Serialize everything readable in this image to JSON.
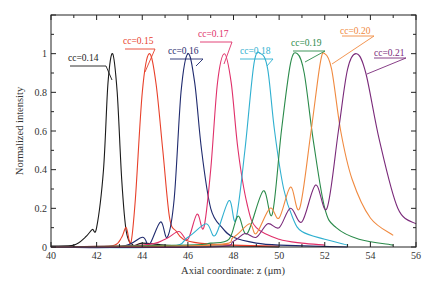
{
  "chart_data": {
    "type": "line",
    "title": "",
    "xlabel": "Axial coordinate: z (μm)",
    "ylabel": "Normalized intensity",
    "xlim": [
      40,
      56
    ],
    "ylim": [
      0,
      1.2
    ],
    "xticks": [
      "40",
      "42",
      "44",
      "46",
      "48",
      "50",
      "52",
      "54",
      "56"
    ],
    "yticks": [
      "0",
      "0.2",
      "0.4",
      "0.6",
      "0.8",
      "1"
    ],
    "grid": false,
    "legend": "inline annotations",
    "series": [
      {
        "name": "cc=0.14",
        "color": "#1a1a1a",
        "peak_z": 42.7,
        "points": [
          [
            40,
            0.005
          ],
          [
            41,
            0.01
          ],
          [
            41.5,
            0.05
          ],
          [
            41.8,
            0.09
          ],
          [
            42.0,
            0.1
          ],
          [
            42.3,
            0.4
          ],
          [
            42.5,
            0.85
          ],
          [
            42.7,
            1.0
          ],
          [
            42.9,
            0.8
          ],
          [
            43.1,
            0.35
          ],
          [
            43.3,
            0.08
          ],
          [
            43.6,
            0.01
          ],
          [
            44,
            0.02
          ],
          [
            45,
            0.01
          ],
          [
            46,
            0.005
          ],
          [
            48,
            0.005
          ],
          [
            50,
            0.0
          ]
        ]
      },
      {
        "name": "cc=0.15",
        "color": "#e8402a",
        "peak_z": 44.3,
        "points": [
          [
            40,
            0.0
          ],
          [
            42,
            0.0
          ],
          [
            42.8,
            0.01
          ],
          [
            43.1,
            0.05
          ],
          [
            43.3,
            0.1
          ],
          [
            43.5,
            0.02
          ],
          [
            43.7,
            0.25
          ],
          [
            44.0,
            0.8
          ],
          [
            44.3,
            1.0
          ],
          [
            44.6,
            0.85
          ],
          [
            44.9,
            0.5
          ],
          [
            45.2,
            0.15
          ],
          [
            45.5,
            0.08
          ],
          [
            45.8,
            0.04
          ],
          [
            46.5,
            0.02
          ],
          [
            48,
            0.01
          ],
          [
            50,
            0.005
          ]
        ]
      },
      {
        "name": "cc=0.16",
        "color": "#1f2a6e",
        "peak_z": 46.0,
        "points": [
          [
            40,
            0.0
          ],
          [
            43,
            0.0
          ],
          [
            44.0,
            0.05
          ],
          [
            44.3,
            0.01
          ],
          [
            44.8,
            0.13
          ],
          [
            45.1,
            0.05
          ],
          [
            45.4,
            0.25
          ],
          [
            45.7,
            0.8
          ],
          [
            46.0,
            1.0
          ],
          [
            46.3,
            0.85
          ],
          [
            46.6,
            0.5
          ],
          [
            47.0,
            0.2
          ],
          [
            47.5,
            0.1
          ],
          [
            48,
            0.05
          ],
          [
            49,
            0.02
          ],
          [
            50,
            0.01
          ],
          [
            53,
            0.0
          ]
        ]
      },
      {
        "name": "cc=0.17",
        "color": "#e0306a",
        "peak_z": 47.6,
        "points": [
          [
            40,
            0.0
          ],
          [
            44,
            0.01
          ],
          [
            45,
            0.04
          ],
          [
            45.6,
            0.08
          ],
          [
            46.0,
            0.04
          ],
          [
            46.4,
            0.17
          ],
          [
            46.7,
            0.1
          ],
          [
            47.0,
            0.4
          ],
          [
            47.3,
            0.85
          ],
          [
            47.6,
            1.0
          ],
          [
            47.9,
            0.85
          ],
          [
            48.2,
            0.5
          ],
          [
            48.6,
            0.22
          ],
          [
            49,
            0.1
          ],
          [
            50,
            0.04
          ],
          [
            51,
            0.02
          ],
          [
            52,
            0.01
          ]
        ]
      },
      {
        "name": "cc=0.18",
        "color": "#30b0d0",
        "peak_z": 49.2,
        "points": [
          [
            40,
            0.0
          ],
          [
            45,
            0.0
          ],
          [
            46,
            0.05
          ],
          [
            46.8,
            0.12
          ],
          [
            47.2,
            0.06
          ],
          [
            47.8,
            0.24
          ],
          [
            48.1,
            0.14
          ],
          [
            48.5,
            0.5
          ],
          [
            48.9,
            0.95
          ],
          [
            49.2,
            1.0
          ],
          [
            49.5,
            0.92
          ],
          [
            49.8,
            0.6
          ],
          [
            50.2,
            0.3
          ],
          [
            50.6,
            0.15
          ],
          [
            51,
            0.08
          ],
          [
            52,
            0.04
          ],
          [
            53,
            0.01
          ]
        ]
      },
      {
        "name": "cc=0.19",
        "color": "#2a8a4a",
        "peak_z": 50.8,
        "points": [
          [
            40,
            0.0
          ],
          [
            46,
            0.01
          ],
          [
            47,
            0.02
          ],
          [
            47.8,
            0.04
          ],
          [
            48.2,
            0.16
          ],
          [
            48.6,
            0.07
          ],
          [
            49.3,
            0.29
          ],
          [
            49.7,
            0.17
          ],
          [
            50.1,
            0.6
          ],
          [
            50.5,
            0.95
          ],
          [
            50.8,
            1.0
          ],
          [
            51.1,
            0.9
          ],
          [
            51.5,
            0.55
          ],
          [
            52,
            0.2
          ],
          [
            52.5,
            0.1
          ],
          [
            53.5,
            0.04
          ],
          [
            55,
            0.01
          ]
        ]
      },
      {
        "name": "cc=0.20",
        "color": "#f08a40",
        "peak_z": 52.0,
        "points": [
          [
            40,
            0.0
          ],
          [
            47,
            0.01
          ],
          [
            48,
            0.05
          ],
          [
            48.7,
            0.12
          ],
          [
            49.0,
            0.07
          ],
          [
            49.6,
            0.2
          ],
          [
            50.0,
            0.15
          ],
          [
            50.5,
            0.31
          ],
          [
            50.9,
            0.2
          ],
          [
            51.4,
            0.6
          ],
          [
            51.8,
            0.95
          ],
          [
            52.0,
            1.0
          ],
          [
            52.3,
            0.92
          ],
          [
            52.7,
            0.6
          ],
          [
            53.2,
            0.35
          ],
          [
            54.0,
            0.15
          ],
          [
            55,
            0.06
          ]
        ]
      },
      {
        "name": "cc=0.21",
        "color": "#7a2a7a",
        "peak_z": 53.4,
        "points": [
          [
            40,
            0.0
          ],
          [
            47,
            0.0
          ],
          [
            48,
            0.03
          ],
          [
            48.5,
            0.07
          ],
          [
            49.0,
            0.05
          ],
          [
            49.5,
            0.12
          ],
          [
            50.0,
            0.1
          ],
          [
            50.5,
            0.2
          ],
          [
            51.0,
            0.13
          ],
          [
            51.6,
            0.32
          ],
          [
            52.1,
            0.2
          ],
          [
            52.6,
            0.6
          ],
          [
            53.0,
            0.92
          ],
          [
            53.4,
            1.0
          ],
          [
            53.8,
            0.9
          ],
          [
            54.4,
            0.55
          ],
          [
            55.2,
            0.2
          ],
          [
            56,
            0.12
          ]
        ]
      }
    ],
    "annotations": [
      {
        "text": "cc=0.14",
        "color": "#1a1a1a",
        "x": 68,
        "y": 61,
        "lineFrom": [
          70,
          66
        ],
        "mid": [
          106,
          66
        ],
        "to": [
          112,
          80
        ]
      },
      {
        "text": "cc=0.15",
        "color": "#e8402a",
        "x": 123,
        "y": 44,
        "lineFrom": [
          125,
          49
        ],
        "mid": [
          155,
          49
        ],
        "to": [
          145,
          72
        ]
      },
      {
        "text": "cc=0.16",
        "color": "#1f2a6e",
        "x": 168,
        "y": 54,
        "lineFrom": [
          170,
          59
        ],
        "mid": [
          203,
          59
        ],
        "to": [
          196,
          66
        ]
      },
      {
        "text": "cc=0.17",
        "color": "#e0306a",
        "x": 198,
        "y": 37,
        "lineFrom": [
          200,
          42
        ],
        "mid": [
          232,
          42
        ],
        "to": [
          224,
          64
        ]
      },
      {
        "text": "cc=0.18",
        "color": "#30b0d0",
        "x": 240,
        "y": 54,
        "lineFrom": [
          240,
          59
        ],
        "mid": [
          273,
          59
        ],
        "to": [
          267,
          66
        ]
      },
      {
        "text": "cc=0.19",
        "color": "#2a8a4a",
        "x": 291,
        "y": 46,
        "lineFrom": [
          293,
          51
        ],
        "mid": [
          325,
          51
        ],
        "to": [
          305,
          62
        ]
      },
      {
        "text": "cc=0.20",
        "color": "#f08a40",
        "x": 340,
        "y": 34,
        "lineFrom": [
          342,
          36
        ],
        "mid": [
          374,
          36
        ],
        "to": [
          332,
          64
        ]
      },
      {
        "text": "cc=0.21",
        "color": "#7a2a7a",
        "x": 374,
        "y": 56,
        "lineFrom": [
          374,
          58
        ],
        "mid": [
          406,
          58
        ],
        "to": [
          367,
          74
        ]
      }
    ]
  }
}
